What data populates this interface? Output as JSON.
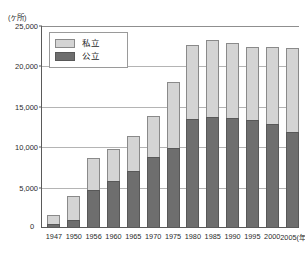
{
  "chart_data": {
    "type": "bar",
    "stacked": true,
    "title": "",
    "subtitle": "",
    "unit_caption": "(ヶ所)",
    "xlabel": "(年)",
    "ylabel": "",
    "ylim": [
      0,
      25000
    ],
    "yticks": [
      0,
      5000,
      10000,
      15000,
      20000,
      25000
    ],
    "ytick_labels": [
      "0",
      "5,000",
      "10,000",
      "15,000",
      "20,000",
      "25,000"
    ],
    "grid": true,
    "legend_position": "top-left",
    "categories": [
      "1947",
      "1950",
      "1956",
      "1960",
      "1965",
      "1970",
      "1975",
      "1980",
      "1985",
      "1990",
      "1995",
      "2000",
      "2005"
    ],
    "xtick_labels": [
      "1947",
      "1950",
      "1956",
      "1960",
      "1965",
      "1970",
      "1975",
      "1980",
      "1985",
      "1990",
      "1995",
      "2000",
      "2005(年)"
    ],
    "series": [
      {
        "name": "公立",
        "color": "#6e6e6e",
        "values": [
          400,
          900,
          4600,
          5700,
          6900,
          8700,
          9800,
          13400,
          13600,
          13500,
          13200,
          12700,
          11800
        ]
      },
      {
        "name": "私立",
        "color": "#d4d4d4",
        "values": [
          1100,
          3000,
          3900,
          4000,
          4400,
          5000,
          8200,
          9100,
          9600,
          9300,
          9100,
          9600,
          10300
        ]
      }
    ],
    "totals": [
      1500,
      3900,
      8500,
      9700,
      11300,
      13700,
      18000,
      22500,
      23200,
      22800,
      22300,
      22300,
      22100
    ]
  },
  "legend": {
    "items": [
      {
        "label": "私立",
        "swatch": "private"
      },
      {
        "label": "公立",
        "swatch": "public"
      }
    ]
  }
}
